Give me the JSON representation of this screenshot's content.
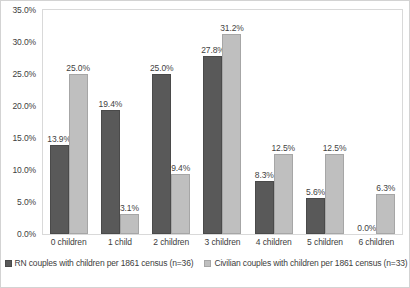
{
  "chart_data": {
    "type": "bar",
    "title": "",
    "subtitle": "",
    "xlabel": "",
    "ylabel": "",
    "ylim": [
      0,
      35
    ],
    "ytick_labels": [
      "0.0%",
      "5.0%",
      "10.0%",
      "15.0%",
      "20.0%",
      "25.0%",
      "30.0%",
      "35.0%"
    ],
    "ytick_values": [
      0,
      5,
      10,
      15,
      20,
      25,
      30,
      35
    ],
    "grid": false,
    "legend_position": "bottom",
    "categories": [
      "0 children",
      "1 child",
      "2 children",
      "3 children",
      "4 children",
      "5 children",
      "6 children"
    ],
    "series": [
      {
        "name": "RN couples with children per 1861 census (n=36)",
        "color": "#595959",
        "values": [
          13.9,
          19.4,
          25.0,
          27.8,
          8.3,
          5.6,
          0.0
        ],
        "labels": [
          "13.9%",
          "19.4%",
          "25.0%",
          "27.8%",
          "8.3%",
          "5.6%",
          "0.0%"
        ]
      },
      {
        "name": "Civilian couples with children per 1861 census (n=33)",
        "color": "#bfbfbf",
        "values": [
          25.0,
          3.1,
          9.4,
          31.2,
          12.5,
          12.5,
          6.3
        ],
        "labels": [
          "25.0%",
          "3.1%",
          "9.4%",
          "31.2%",
          "12.5%",
          "12.5%",
          "6.3%"
        ]
      }
    ]
  }
}
